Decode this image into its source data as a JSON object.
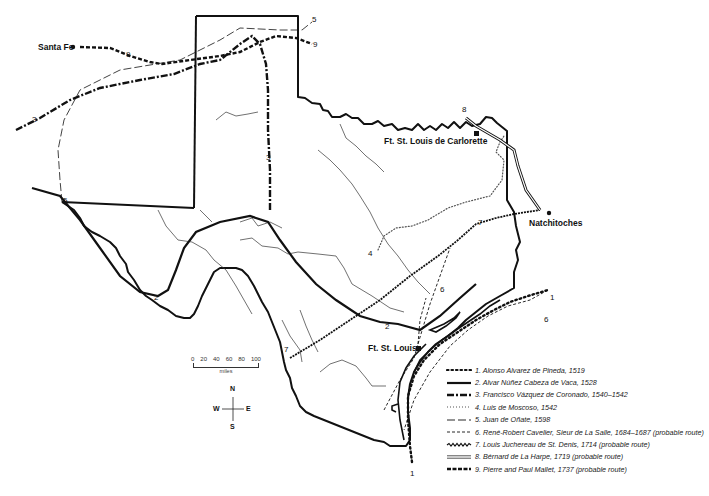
{
  "map": {
    "title": "Routes of early explorers across Texas",
    "places": {
      "santa_fe": "Santa Fe",
      "ft_carlorette": "Ft. St. Louis de Carlorette",
      "natchitoches": "Natchitoches",
      "ft_st_louis": "Ft. St. Louis"
    },
    "route_labels": {
      "r1_end": "1",
      "r1_start": "1",
      "r2_a": "2",
      "r2_b": "2",
      "r3_a": "3",
      "r3_b": "3",
      "r4": "4",
      "r5_a": "5",
      "r5_b": "5",
      "r6_a": "6",
      "r6_b": "6",
      "r7_a": "7",
      "r7_b": "7",
      "r8": "8",
      "r9_a": "9",
      "r9_b": "9"
    }
  },
  "scale": {
    "ticks": [
      "0",
      "20",
      "40",
      "60",
      "80",
      "100"
    ],
    "units": "miles"
  },
  "compass": {
    "n": "N",
    "s": "S",
    "e": "E",
    "w": "W"
  },
  "legend": [
    {
      "id": 1,
      "style": "dotted-bold",
      "label": "1. Alonso Alvarez de Pineda, 1519"
    },
    {
      "id": 2,
      "style": "solid-thick",
      "label": "2. Alvar Núñez Cabeza de Vaca, 1528"
    },
    {
      "id": 3,
      "style": "dash-dot-thick",
      "label": "3. Francisco Vázquez de Coronado, 1540–1542"
    },
    {
      "id": 4,
      "style": "small-dots",
      "label": "4. Luis de Moscoso, 1542"
    },
    {
      "id": 5,
      "style": "long-dash-thin",
      "label": "5. Juan de Oñate, 1598"
    },
    {
      "id": 6,
      "style": "short-dash",
      "label": "6. René-Robert Cavelier, Sieur de La Salle, 1684–1687 (probable route)"
    },
    {
      "id": 7,
      "style": "zigzag",
      "label": "7. Louis Juchereau de St. Denis, 1714 (probable route)"
    },
    {
      "id": 8,
      "style": "double-line",
      "label": "8. Bérnard de La Harpe, 1719 (probable route)"
    },
    {
      "id": 9,
      "style": "dashed-bold",
      "label": "9. Pierre and Paul Mallet, 1737 (probable route)"
    }
  ]
}
